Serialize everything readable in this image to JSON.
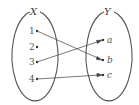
{
  "diagram": {
    "type": "function-mapping",
    "domain_set": {
      "name": "X",
      "elements": [
        "1",
        "2",
        "3",
        "4"
      ]
    },
    "codomain_set": {
      "name": "Y",
      "elements": [
        "a",
        "b",
        "c"
      ]
    },
    "mappings": [
      {
        "from": "1",
        "to": "b"
      },
      {
        "from": "3",
        "to": "a"
      },
      {
        "from": "4",
        "to": "c"
      }
    ],
    "colors": {
      "stroke": "#555555",
      "text": "#444444",
      "background": "#ffffff"
    }
  }
}
